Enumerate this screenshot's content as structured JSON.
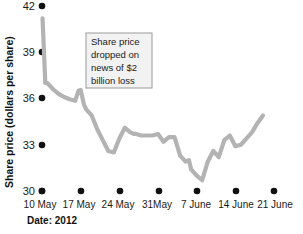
{
  "chart_data": {
    "type": "line",
    "title": "",
    "subtitle": "",
    "xlabel": "Date: 2012",
    "ylabel": "Share price (dollars per share)",
    "ylim": [
      30,
      42
    ],
    "yticks": [
      30,
      33,
      36,
      39,
      42
    ],
    "ytick_labels": [
      "30",
      "33",
      "36",
      "39",
      "42"
    ],
    "xticks": [
      0,
      7,
      14,
      21,
      28,
      35,
      42
    ],
    "xtick_labels": [
      "10 May",
      "17 May",
      "24 May",
      "31May",
      "7 June",
      "14 June",
      "21 June"
    ],
    "grid": false,
    "legend": "none",
    "line_color": "#b3b3b3",
    "series": [
      {
        "name": "Share price",
        "x": [
          0.1,
          0.6,
          1.0,
          2.0,
          3.0,
          4.0,
          5.0,
          6.0,
          6.6,
          7.0,
          7.6,
          8.0,
          9.0,
          10.0,
          11.0,
          12.0,
          13.0,
          14.0,
          15.0,
          16.0,
          16.6,
          17.0,
          18.0,
          19.0,
          20.0,
          21.0,
          22.0,
          23.0,
          24.0,
          25.0,
          26.0,
          26.6,
          27.0,
          28.0,
          29.0,
          30.0,
          31.0,
          32.0,
          33.0,
          34.0,
          35.0,
          36.0,
          37.0,
          38.0,
          39.0,
          40.0
        ],
        "values": [
          41.2,
          37.0,
          37.0,
          36.6,
          36.3,
          36.1,
          35.95,
          35.85,
          36.5,
          36.55,
          35.6,
          35.3,
          34.9,
          34.0,
          33.3,
          32.6,
          32.5,
          33.4,
          34.1,
          33.8,
          33.7,
          33.7,
          33.6,
          33.6,
          33.6,
          33.7,
          33.2,
          33.5,
          33.5,
          32.3,
          31.9,
          32.0,
          31.4,
          31.0,
          30.7,
          31.9,
          32.6,
          32.2,
          33.3,
          33.6,
          32.9,
          33.0,
          33.4,
          33.8,
          34.4,
          34.9
        ]
      }
    ],
    "annotation": {
      "text_lines": [
        "Share price",
        "dropped on",
        "news of $2",
        "billion loss"
      ]
    }
  }
}
